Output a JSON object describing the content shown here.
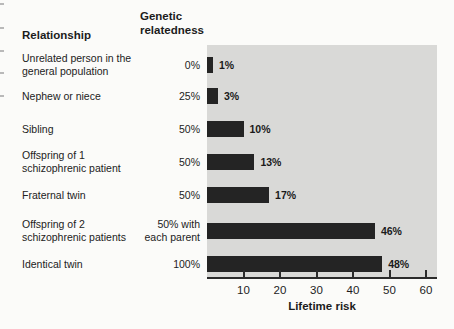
{
  "page": {
    "background": "#fbfbf9"
  },
  "table": {
    "relationship_header": "Relationship",
    "relatedness_header": "Genetic\nrelatedness"
  },
  "chart_data": {
    "type": "bar",
    "orientation": "horizontal",
    "title": "",
    "xlabel": "Lifetime risk",
    "ylabel": "",
    "xlim": [
      0,
      60
    ],
    "xticks": [
      10,
      20,
      30,
      40,
      50,
      60
    ],
    "grid": false,
    "legend": "none",
    "plot_bg": "#d9d9d7",
    "bar_color": "#242424",
    "categories": [
      "Unrelated person in the\ngeneral population",
      "Nephew or niece",
      "Sibling",
      "Offspring of 1\nschizophrenic patient",
      "Fraternal twin",
      "Offspring of 2\nschizophrenic patients",
      "Identical twin"
    ],
    "genetic_relatedness": [
      "0%",
      "25%",
      "50%",
      "50%",
      "50%",
      "50% with\neach parent",
      "100%"
    ],
    "values": [
      1,
      3,
      10,
      13,
      17,
      46,
      48
    ],
    "value_labels": [
      "1%",
      "3%",
      "10%",
      "13%",
      "17%",
      "46%",
      "48%"
    ]
  }
}
